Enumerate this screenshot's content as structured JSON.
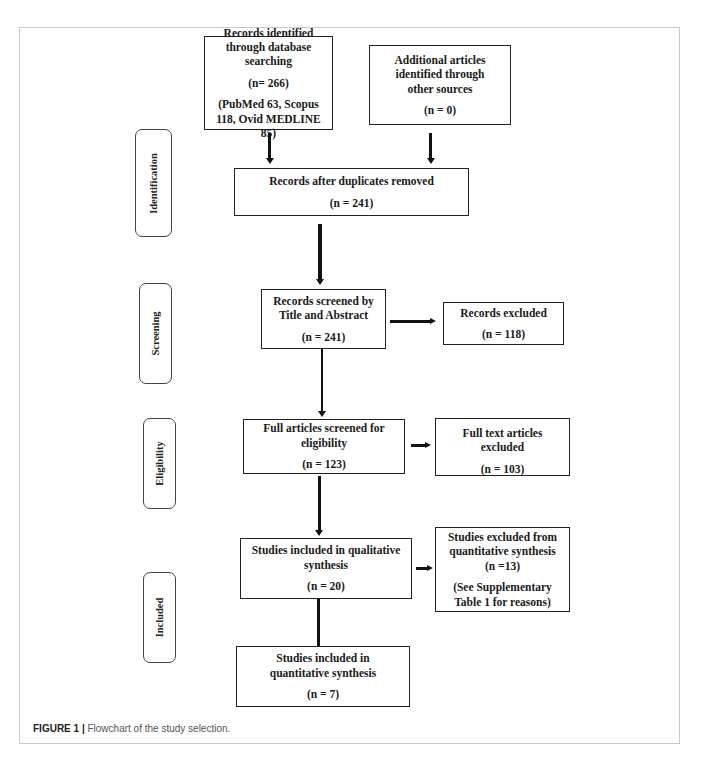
{
  "stages": {
    "identification": "Identification",
    "screening": "Screening",
    "eligibility": "Eligibility",
    "included": "Included"
  },
  "boxes": {
    "database_search": {
      "title": "Records identified through database searching",
      "count": "(n= 266)",
      "detail": "(PubMed 63, Scopus 118, Ovid MEDLINE 85)"
    },
    "other_sources": {
      "title": "Additional articles identified through other sources",
      "count": "(n = 0)"
    },
    "after_duplicates": {
      "title": "Records after duplicates removed",
      "count": "(n = 241)"
    },
    "screened": {
      "title": "Records screened by Title and Abstract",
      "count": "(n = 241)"
    },
    "records_excluded": {
      "title": "Records excluded",
      "count": "(n = 118)"
    },
    "full_articles": {
      "title": "Full articles screened for eligibility",
      "count": "(n = 123)"
    },
    "full_text_excluded": {
      "title": "Full text articles excluded",
      "count": "(n = 103)"
    },
    "qualitative": {
      "title": "Studies included in qualitative synthesis",
      "count": "(n = 20)"
    },
    "excluded_quantitative": {
      "title": "Studies excluded from quantitative synthesis (n =13)",
      "detail": "(See Supplementary Table 1 for reasons)"
    },
    "quantitative": {
      "title": "Studies included in quantitative synthesis",
      "count": "(n = 7)"
    }
  },
  "caption": {
    "label": "FIGURE 1 |",
    "text": " Flowchart of the study selection."
  }
}
